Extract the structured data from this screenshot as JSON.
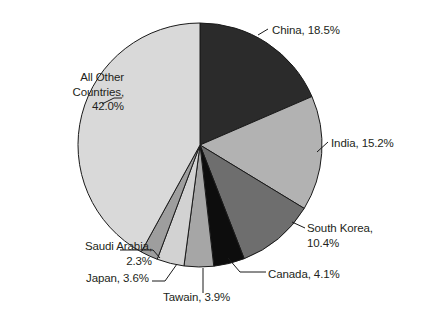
{
  "chart_data": {
    "type": "pie",
    "title": "",
    "categories": [
      "China",
      "India",
      "South Korea",
      "Canada",
      "Tawain",
      "Japan",
      "Saudi Arabia",
      "All Other Countries"
    ],
    "values": [
      18.5,
      15.2,
      10.4,
      4.1,
      3.9,
      3.6,
      2.3,
      42.0
    ],
    "units": "%",
    "legend": "none",
    "grid": false,
    "start_angle_deg": 0,
    "direction": "clockwise",
    "slices": [
      {
        "name": "China",
        "value": 18.5,
        "label": "China, 18.5%",
        "color": "#2b2b2b"
      },
      {
        "name": "India",
        "value": 15.2,
        "label": "India, 15.2%",
        "color": "#b2b2b2"
      },
      {
        "name": "South Korea",
        "value": 10.4,
        "label": "South Korea,\n10.4%",
        "color": "#6e6e6e"
      },
      {
        "name": "Canada",
        "value": 4.1,
        "label": "Canada, 4.1%",
        "color": "#0d0d0d"
      },
      {
        "name": "Tawain",
        "value": 3.9,
        "label": "Tawain, 3.9%",
        "color": "#a6a6a6"
      },
      {
        "name": "Japan",
        "value": 3.6,
        "label": "Japan, 3.6%",
        "color": "#d2d2d2"
      },
      {
        "name": "Saudi Arabia",
        "value": 2.3,
        "label": "Saudi Arabia,\n2.3%",
        "color": "#9e9e9e"
      },
      {
        "name": "All Other Countries",
        "value": 42.0,
        "label": "All Other\nCountries,\n42.0%",
        "color": "#d9d9d9"
      }
    ]
  },
  "labels": {
    "china": "China, 18.5%",
    "india": "India, 15.2%",
    "south_korea": "South Korea,\n10.4%",
    "canada": "Canada, 4.1%",
    "taiwan": "Tawain, 3.9%",
    "japan": "Japan, 3.6%",
    "saudi_arabia": "Saudi Arabia,\n2.3%",
    "all_other": "All Other\nCountries,\n42.0%"
  },
  "style": {
    "background": "#ffffff",
    "outline": "#1a1a1a",
    "text": "#231f20",
    "leader_line": "#1a1a1a"
  }
}
